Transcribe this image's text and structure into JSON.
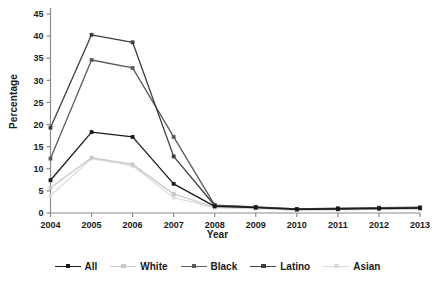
{
  "chart_data": {
    "type": "line",
    "title": "",
    "xlabel": "Year",
    "ylabel": "Percentage",
    "categories": [
      "2004",
      "2005",
      "2006",
      "2007",
      "2008",
      "2009",
      "2010",
      "2011",
      "2012",
      "2013"
    ],
    "x": [
      2004,
      2005,
      2006,
      2007,
      2008,
      2009,
      2010,
      2011,
      2012,
      2013
    ],
    "ylim": [
      0,
      45
    ],
    "yticks": [
      0,
      5,
      10,
      15,
      20,
      25,
      30,
      35,
      40,
      45
    ],
    "grid": false,
    "legend_position": "bottom",
    "series": [
      {
        "name": "All",
        "color": "#1a1a1a",
        "values": [
          7.4,
          18.3,
          17.2,
          6.6,
          1.5,
          1.2,
          0.8,
          0.9,
          1.0,
          1.1
        ]
      },
      {
        "name": "White",
        "color": "#c8c8c8",
        "values": [
          5.7,
          12.5,
          11.0,
          4.3,
          1.3,
          1.1,
          0.7,
          0.8,
          0.9,
          1.0
        ]
      },
      {
        "name": "Black",
        "color": "#5a5a5a",
        "values": [
          12.3,
          34.6,
          32.8,
          17.2,
          1.8,
          1.4,
          0.9,
          1.1,
          1.2,
          1.3
        ]
      },
      {
        "name": "Latino",
        "color": "#3d3d3d",
        "values": [
          19.3,
          40.3,
          38.6,
          12.8,
          1.7,
          1.3,
          0.9,
          1.0,
          1.1,
          1.2
        ]
      },
      {
        "name": "Asian",
        "color": "#dcdcdc",
        "values": [
          3.9,
          12.3,
          10.7,
          3.5,
          1.2,
          1.0,
          0.6,
          0.7,
          0.8,
          0.9
        ]
      }
    ]
  },
  "axes": {
    "y_title": "Percentage",
    "x_title": "Year",
    "ytick_labels": [
      "0",
      "5",
      "10",
      "15",
      "20",
      "25",
      "30",
      "35",
      "40",
      "45"
    ],
    "xtick_labels": [
      "2004",
      "2005",
      "2006",
      "2007",
      "2008",
      "2009",
      "2010",
      "2011",
      "2012",
      "2013"
    ]
  },
  "legend": {
    "items": [
      {
        "label": "All",
        "color": "#1a1a1a"
      },
      {
        "label": "White",
        "color": "#c8c8c8"
      },
      {
        "label": "Black",
        "color": "#5a5a5a"
      },
      {
        "label": "Latino",
        "color": "#3d3d3d"
      },
      {
        "label": "Asian",
        "color": "#dcdcdc"
      }
    ]
  },
  "style": {
    "axis_color": "#8c8c8c",
    "text_color": "#1a1a1a",
    "background": "#ffffff"
  }
}
